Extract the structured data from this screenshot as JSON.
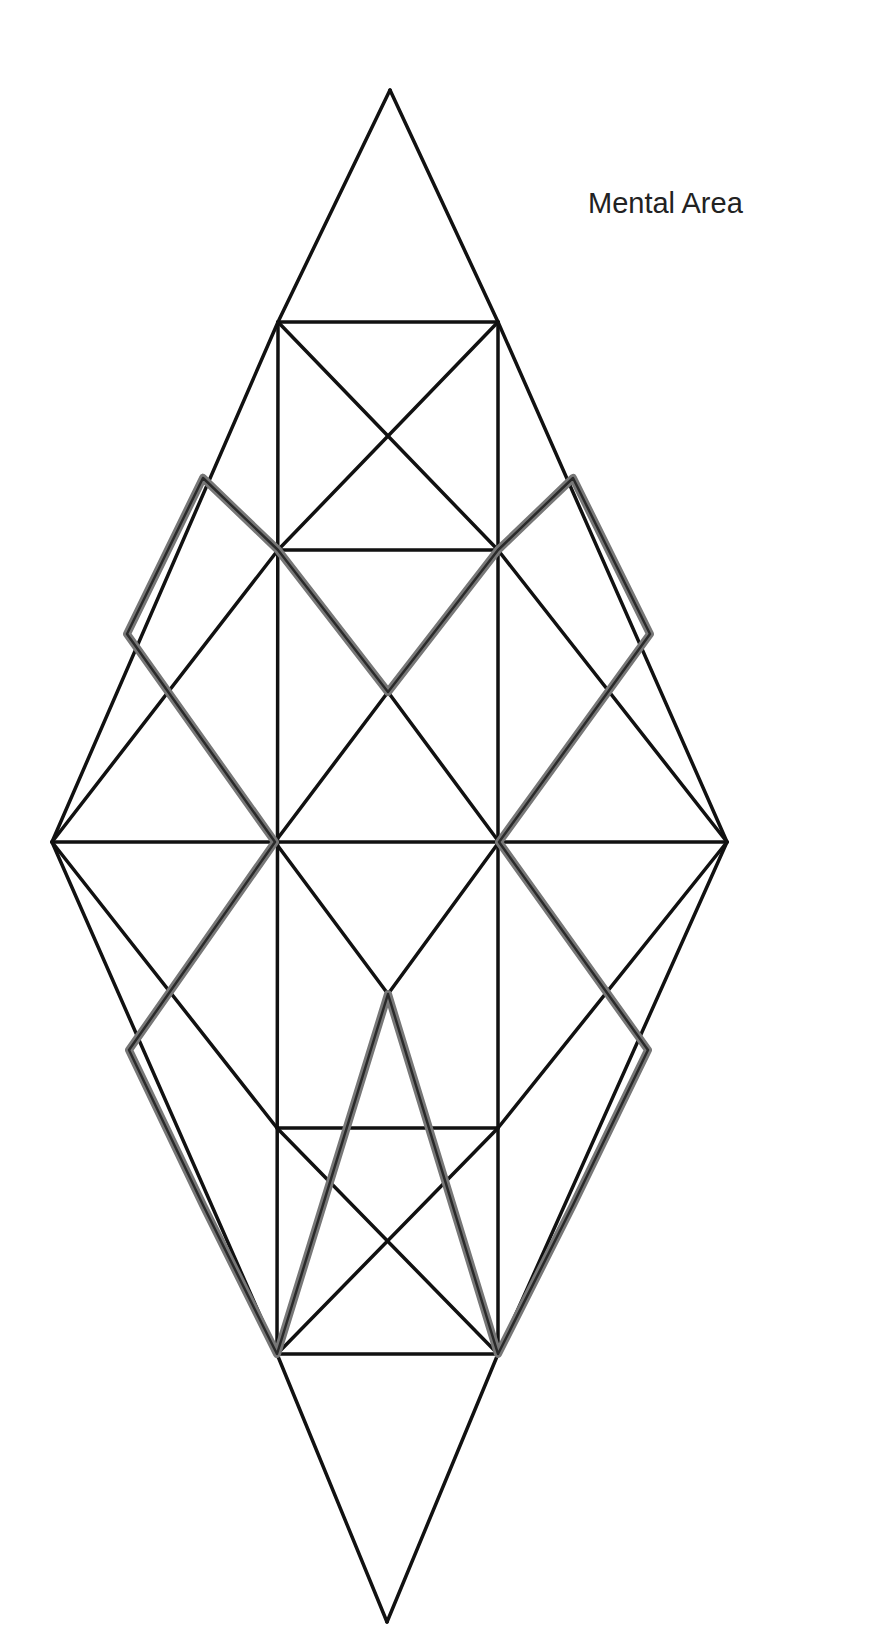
{
  "diagram": {
    "label": "Mental Area",
    "colors": {
      "background": "#ffffff",
      "line": "#111111",
      "highlight": "#777777"
    },
    "points": {
      "top": [
        390,
        90
      ],
      "bottom": [
        387,
        1622
      ],
      "left": [
        52,
        842
      ],
      "right": [
        727,
        842
      ],
      "sq1_tl": [
        278,
        322
      ],
      "sq1_tr": [
        498,
        322
      ],
      "sq1_bl": [
        278,
        550
      ],
      "sq1_br": [
        498,
        550
      ],
      "sq1_c": [
        388,
        436
      ],
      "mid_l": [
        275,
        842
      ],
      "mid_r": [
        499,
        842
      ],
      "cen_top": [
        388,
        692
      ],
      "cen_bot": [
        388,
        994
      ],
      "sq2_tl": [
        277,
        1128
      ],
      "sq2_tr": [
        498,
        1128
      ],
      "sq2_bl": [
        277,
        1354
      ],
      "sq2_br": [
        498,
        1354
      ],
      "sq2_c": [
        387,
        1241
      ],
      "hl_ul_top": [
        203,
        478
      ],
      "hl_ul_left": [
        127,
        634
      ],
      "hl_ur_top": [
        573,
        478
      ],
      "hl_ur_right": [
        650,
        634
      ],
      "hl_ll_left": [
        129,
        1050
      ],
      "hl_ll_bot": [
        203,
        1205
      ],
      "hl_lr_right": [
        648,
        1050
      ],
      "hl_lr_bot": [
        573,
        1205
      ]
    },
    "black_lines": [
      [
        "top",
        "sq1_tl"
      ],
      [
        "top",
        "sq1_tr"
      ],
      [
        "sq1_tl",
        "sq1_tr"
      ],
      [
        "sq1_bl",
        "sq1_br"
      ],
      [
        "sq1_tl",
        "sq1_br"
      ],
      [
        "sq1_tr",
        "sq1_bl"
      ],
      [
        "sq1_tl",
        "sq2_bl"
      ],
      [
        "sq1_tr",
        "sq2_br"
      ],
      [
        "sq1_tl",
        "left"
      ],
      [
        "left",
        "sq2_bl"
      ],
      [
        "sq1_tr",
        "right"
      ],
      [
        "right",
        "sq2_br"
      ],
      [
        "left",
        "right"
      ],
      [
        "sq1_bl",
        "left"
      ],
      [
        "left",
        "sq2_tl"
      ],
      [
        "sq1_br",
        "right"
      ],
      [
        "right",
        "sq2_tr"
      ],
      [
        "mid_l",
        "cen_top"
      ],
      [
        "cen_top",
        "mid_r"
      ],
      [
        "mid_l",
        "cen_bot"
      ],
      [
        "cen_bot",
        "mid_r"
      ],
      [
        "sq2_tl",
        "sq2_tr"
      ],
      [
        "sq2_bl",
        "sq2_br"
      ],
      [
        "sq2_tl",
        "sq2_br"
      ],
      [
        "sq2_tr",
        "sq2_bl"
      ],
      [
        "sq2_bl",
        "bottom"
      ],
      [
        "sq2_br",
        "bottom"
      ]
    ],
    "highlight_paths": [
      [
        "hl_ul_top",
        "hl_ul_left",
        "mid_l",
        "hl_ll_left",
        "hl_ll_bot",
        "sq2_bl",
        "cen_bot",
        "sq2_br",
        "hl_lr_bot",
        "hl_lr_right",
        "mid_r",
        "hl_ur_right",
        "hl_ur_top",
        "sq1_br",
        "cen_top",
        "sq1_bl",
        "hl_ul_top"
      ]
    ]
  }
}
